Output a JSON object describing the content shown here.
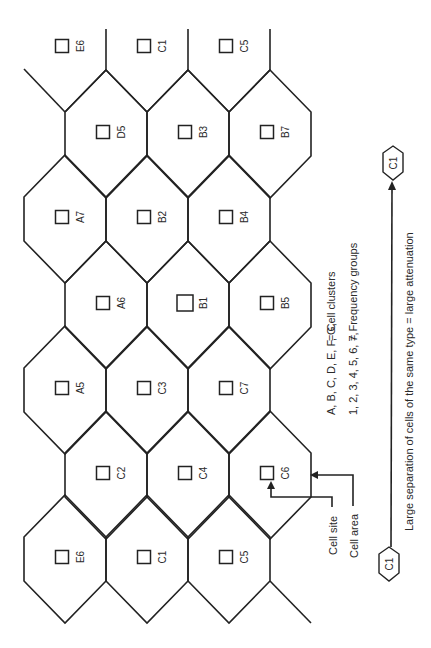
{
  "diagram": {
    "orientation": "rotated-90",
    "colors": {
      "line": "#222222",
      "text": "#2a2a2a",
      "background": "#ffffff"
    },
    "grid": {
      "half_width": 41,
      "apex_offset": 64,
      "shoulder_offset": 22,
      "rows": [
        {
          "cy": 48,
          "partial": true,
          "cells": [
            {
              "cx": 65,
              "label": "E6"
            },
            {
              "cx": 147,
              "label": "C1"
            },
            {
              "cx": 229,
              "label": "C5"
            }
          ]
        },
        {
          "cy": 134,
          "cells": [
            {
              "cx": 106,
              "label": "D5"
            },
            {
              "cx": 188,
              "label": "B3"
            },
            {
              "cx": 270,
              "label": "B7"
            }
          ]
        },
        {
          "cy": 219,
          "cells": [
            {
              "cx": 65,
              "label": "A7"
            },
            {
              "cx": 147,
              "label": "B2"
            },
            {
              "cx": 229,
              "label": "B4"
            }
          ]
        },
        {
          "cy": 305,
          "cells": [
            {
              "cx": 106,
              "label": "A6"
            },
            {
              "cx": 188,
              "label": "B1",
              "large": true
            },
            {
              "cx": 270,
              "label": "B5"
            }
          ]
        },
        {
          "cy": 390,
          "cells": [
            {
              "cx": 65,
              "label": "A5"
            },
            {
              "cx": 147,
              "label": "C3"
            },
            {
              "cx": 229,
              "label": "C7"
            }
          ]
        },
        {
          "cy": 475,
          "cells": [
            {
              "cx": 106,
              "label": "C2"
            },
            {
              "cx": 188,
              "label": "C4"
            },
            {
              "cx": 270,
              "label": "C6"
            }
          ]
        },
        {
          "cy": 559,
          "cells": [
            {
              "cx": 65,
              "label": "E6"
            },
            {
              "cx": 147,
              "label": "C1"
            },
            {
              "cx": 229,
              "label": "C5"
            }
          ]
        }
      ],
      "extra_edges": [
        [
          [
            106,
            29
          ],
          [
            106,
            70
          ]
        ],
        [
          [
            188,
            29
          ],
          [
            188,
            70
          ]
        ],
        [
          [
            270,
            29
          ],
          [
            270,
            70
          ]
        ],
        [
          [
            24,
            69
          ],
          [
            65,
            112
          ]
        ],
        [
          [
            65,
            112
          ],
          [
            106,
            70
          ]
        ],
        [
          [
            106,
            70
          ],
          [
            147,
            112
          ]
        ],
        [
          [
            147,
            112
          ],
          [
            188,
            70
          ]
        ],
        [
          [
            188,
            70
          ],
          [
            229,
            112
          ]
        ],
        [
          [
            229,
            112
          ],
          [
            270,
            70
          ]
        ],
        [
          [
            270,
            581
          ],
          [
            311,
            623
          ]
        ]
      ]
    },
    "annotations": {
      "cell_site_label": "Cell site",
      "cell_area_label": "Cell area"
    },
    "legend": {
      "clusters_list": "A, B, C, D, E, F, G,",
      "clusters_meaning": "= Cell clusters",
      "groups_list": "1, 2, 3, 4, 5, 6, 7,",
      "groups_meaning": "= Frequency groups"
    },
    "separation": {
      "start_marker": "C1",
      "end_marker": "C1",
      "caption": "Large separation of cells of the same type = large attenuation"
    }
  }
}
